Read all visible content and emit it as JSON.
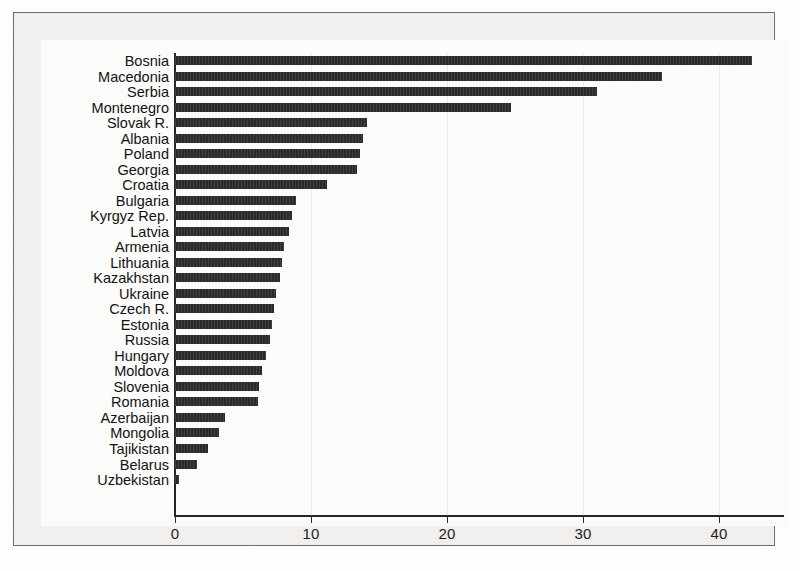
{
  "figure": {
    "background_color": "#f2f1ef",
    "plot_background_color": "#fbfbfa",
    "frame_color": "#6e6e6e",
    "bar_color": "#2a2a2a",
    "axis_color": "#262626"
  },
  "chart_data": {
    "type": "bar",
    "orientation": "horizontal",
    "title": "",
    "subtitle": "",
    "xlabel": "",
    "ylabel": "",
    "xlim": [
      0,
      44.8
    ],
    "xticks": [
      0,
      10,
      20,
      30,
      40
    ],
    "xtick_labels": [
      "0",
      "10",
      "20",
      "30",
      "40"
    ],
    "grid": false,
    "legend": null,
    "categories": [
      "Bosnia",
      "Macedonia",
      "Serbia",
      "Montenegro",
      "Slovak R.",
      "Albania",
      "Poland",
      "Georgia",
      "Croatia",
      "Bulgaria",
      "Kyrgyz Rep.",
      "Latvia",
      "Armenia",
      "Lithuania",
      "Kazakhstan",
      "Ukraine",
      "Czech R.",
      "Estonia",
      "Russia",
      "Hungary",
      "Moldova",
      "Slovenia",
      "Romania",
      "Azerbaijan",
      "Mongolia",
      "Tajikistan",
      "Belarus",
      "Uzbekistan"
    ],
    "values": [
      42.4,
      35.8,
      31.0,
      24.7,
      14.1,
      13.8,
      13.6,
      13.4,
      11.2,
      8.9,
      8.6,
      8.4,
      8.0,
      7.9,
      7.7,
      7.4,
      7.3,
      7.1,
      7.0,
      6.7,
      6.4,
      6.2,
      6.1,
      3.7,
      3.2,
      2.4,
      1.6,
      0.3
    ]
  }
}
